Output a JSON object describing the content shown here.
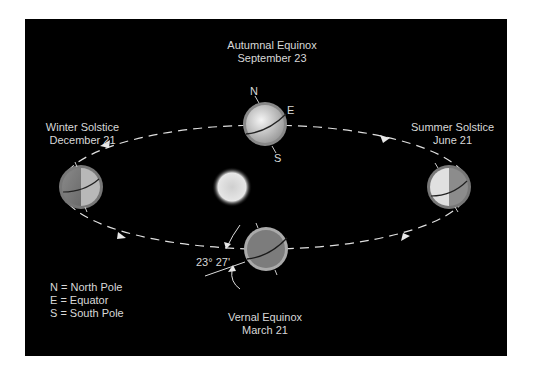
{
  "labels": {
    "autumnal": {
      "name": "Autumnal Equinox",
      "date": "September 23"
    },
    "winter": {
      "name": "Winter Solstice",
      "date": "December 21"
    },
    "summer": {
      "name": "Summer Solstice",
      "date": "June 21"
    },
    "vernal": {
      "name": "Vernal Equinox",
      "date": "March 21"
    }
  },
  "pole_labels": {
    "north": "N",
    "equator": "E",
    "south": "S"
  },
  "tilt_angle": "23° 27'",
  "legend": [
    "N = North Pole",
    "E = Equator",
    "S = South Pole"
  ],
  "colors": {
    "background": "#000000",
    "text": "#d8d8d8",
    "orbit": "#e0e0e0"
  }
}
